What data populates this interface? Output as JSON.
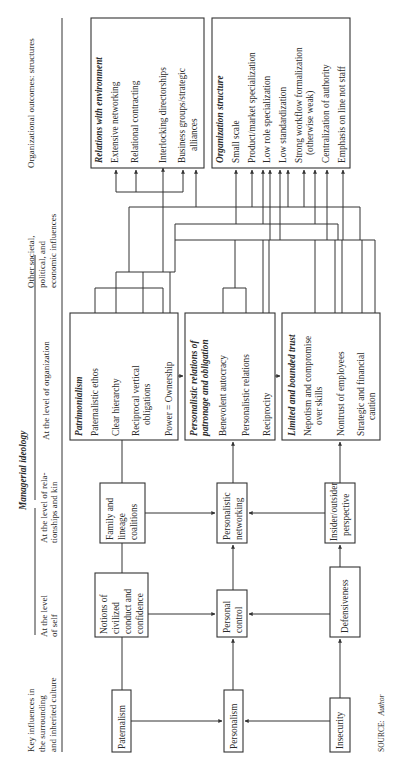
{
  "figure": {
    "orientation": "rotated-90-ccw",
    "header": {
      "key_influences": [
        "Key influences in",
        "the surrounding",
        "and inherited culture"
      ],
      "managerial_ideology": "Managerial ideology",
      "level_self": [
        "At the level",
        "of self"
      ],
      "level_relationships": [
        "At the level of rela-",
        "tionships and kin"
      ],
      "level_organization": "At the level of organization",
      "other_influences": [
        "Other societal,",
        "political, and",
        "economic influences"
      ],
      "outcomes": "Organizational outcomes: structures"
    },
    "culture_boxes": {
      "paternalism": "Paternalism",
      "personalism": "Personalism",
      "insecurity": "Insecurity"
    },
    "self_boxes": {
      "notions": [
        "Notions of",
        "civilized",
        "conduct and",
        "confidence"
      ],
      "personal_control": [
        "Personal",
        "control"
      ],
      "defensiveness": "Defensiveness"
    },
    "relationship_boxes": {
      "family": [
        "Family and",
        "lineage",
        "coalitions"
      ],
      "networking": [
        "Personalistic",
        "networking"
      ],
      "insider": [
        "Insider/outsider",
        "perspective"
      ]
    },
    "organization_boxes": {
      "patrimonialism": {
        "title": "Patrimonialism",
        "items": [
          "Paternalistic ethos",
          "Clear hierarchy",
          "Reciprocal vertical",
          "obligations",
          "Power = Ownership"
        ]
      },
      "personalistic_relations": {
        "title": [
          "Personalistic relations of",
          "patronage and obligation"
        ],
        "items": [
          "Benevolent autocracy",
          "Personalistic relations",
          "Reciprocity"
        ]
      },
      "limited_trust": {
        "title": "Limited and bounded trust",
        "items": [
          "Nepotism and compromise",
          "over skills",
          "Nontrust of employees",
          "Strategic and financial",
          "caution"
        ]
      }
    },
    "outcome_boxes": {
      "relations_environment": {
        "title": "Relations with environment",
        "items": [
          "Extensive networking",
          "Relational contracting",
          "Interlocking directorships",
          "Business groups/strategic",
          "alliances"
        ]
      },
      "organization_structure": {
        "title": "Organization structure",
        "items": [
          "Small scale",
          "Product/market specialization",
          "Low role specialization",
          "Low standardization",
          "Strong workflow formalization",
          "(otherwise weak)",
          "Centralization of authority",
          "Emphasis on line not staff"
        ]
      }
    },
    "source": {
      "label": "SOURCE:",
      "value": "Author"
    }
  }
}
